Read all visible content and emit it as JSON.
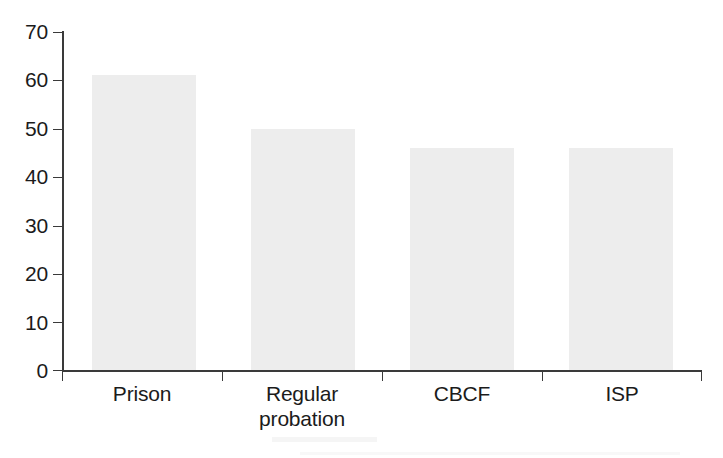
{
  "chart_data": {
    "type": "bar",
    "title": "",
    "subtitle": "",
    "xlabel": "",
    "ylabel": "",
    "categories": [
      "Prison",
      "Regular probation",
      "CBCF",
      "ISP"
    ],
    "category_lines": [
      [
        "Prison"
      ],
      [
        "Regular",
        "probation"
      ],
      [
        "CBCF"
      ],
      [
        "ISP"
      ]
    ],
    "values": [
      61,
      50,
      46,
      46
    ],
    "ylim": [
      0,
      70
    ],
    "yticks": [
      0,
      10,
      20,
      30,
      40,
      50,
      60,
      70
    ],
    "ytick_labels": [
      "0",
      "10",
      "20",
      "30",
      "40",
      "50",
      "60",
      "70"
    ],
    "grid": false,
    "legend": null,
    "legend_position": "none",
    "annotations": [],
    "bar_color": "#ededed",
    "axis_color": "#3a3a3a",
    "text_color": "#1b1b1b"
  }
}
